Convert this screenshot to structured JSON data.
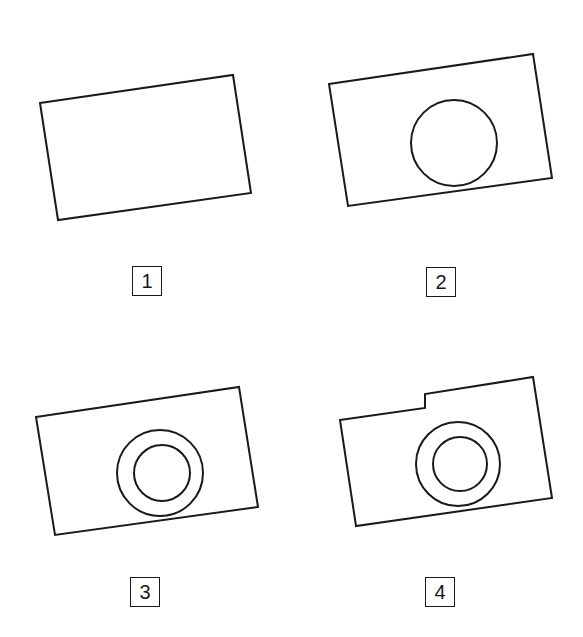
{
  "diagram": {
    "title": "",
    "stroke_color": "#1a1a1a",
    "background": "#ffffff",
    "steps": [
      {
        "label": "1",
        "description": "tilted rectangle (camera body outline)",
        "body_points": "40,103 233,75 251,193 58,220",
        "circles": [],
        "label_pos": {
          "x": 132,
          "y": 266
        }
      },
      {
        "label": "2",
        "description": "rectangle with a circle (lens) added",
        "body_points": "329,84 533,54 552,178 348,206",
        "circles": [
          {
            "cx": 454,
            "cy": 143,
            "r": 43
          }
        ],
        "label_pos": {
          "x": 426,
          "y": 267
        }
      },
      {
        "label": "3",
        "description": "rectangle with concentric double circle lens",
        "body_points": "36,417 239,387 258,507 55,535",
        "circles": [
          {
            "cx": 160,
            "cy": 473,
            "r": 43
          },
          {
            "cx": 162,
            "cy": 473,
            "r": 28
          }
        ],
        "label_pos": {
          "x": 130,
          "y": 577
        }
      },
      {
        "label": "4",
        "description": "camera body with top notch and double circle lens",
        "body_points": "340,420 425,408 425,394 533,377 552,498 356,526",
        "circles": [
          {
            "cx": 458,
            "cy": 464,
            "r": 42
          },
          {
            "cx": 460,
            "cy": 464,
            "r": 27
          }
        ],
        "label_pos": {
          "x": 425,
          "y": 577
        }
      }
    ]
  }
}
